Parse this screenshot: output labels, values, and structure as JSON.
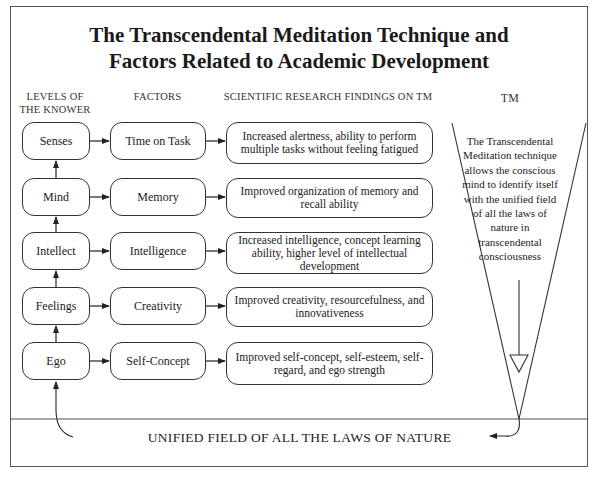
{
  "title": {
    "line1": "The Transcendental Meditation Technique and",
    "line2": "Factors Related to Academic Development"
  },
  "headers": {
    "levels_line1": "LEVELS OF",
    "levels_line2": "THE KNOWER",
    "factors": "FACTORS",
    "findings": "SCIENTIFIC RESEARCH FINDINGS ON TM",
    "tm": "TM"
  },
  "rows": [
    {
      "level": "Senses",
      "factor": "Time on Task",
      "finding": "Increased alertness, ability to perform multiple tasks without feeling fatigued"
    },
    {
      "level": "Mind",
      "factor": "Memory",
      "finding": "Improved organization of memory and recall ability"
    },
    {
      "level": "Intellect",
      "factor": "Intelligence",
      "finding": "Increased  intelligence, concept learning ability, higher level of intellectual development"
    },
    {
      "level": "Feelings",
      "factor": "Creativity",
      "finding": "Improved creativity, resourcefulness, and innovativeness"
    },
    {
      "level": "Ego",
      "factor": "Self-Concept",
      "finding": "Improved self-concept, self-esteem, self-regard, and ego strength"
    }
  ],
  "tm_description": "The Transcendental Meditation technique allows the conscious mind to identify itself with the unified field of all the laws of nature in transcendental consciousness",
  "unified_field": "UNIFIED FIELD OF ALL THE LAWS OF NATURE",
  "icons": {
    "row_arrow": "arrow-right-icon",
    "level_arrow": "arrow-up-icon",
    "funnel": "inverted-triangle-icon",
    "down_arrow": "hollow-arrow-down-icon",
    "loop_arrow": "curved-arrow-icon"
  },
  "colors": {
    "line": "#333333",
    "frame": "#555555",
    "text": "#222222",
    "background": "#ffffff"
  }
}
